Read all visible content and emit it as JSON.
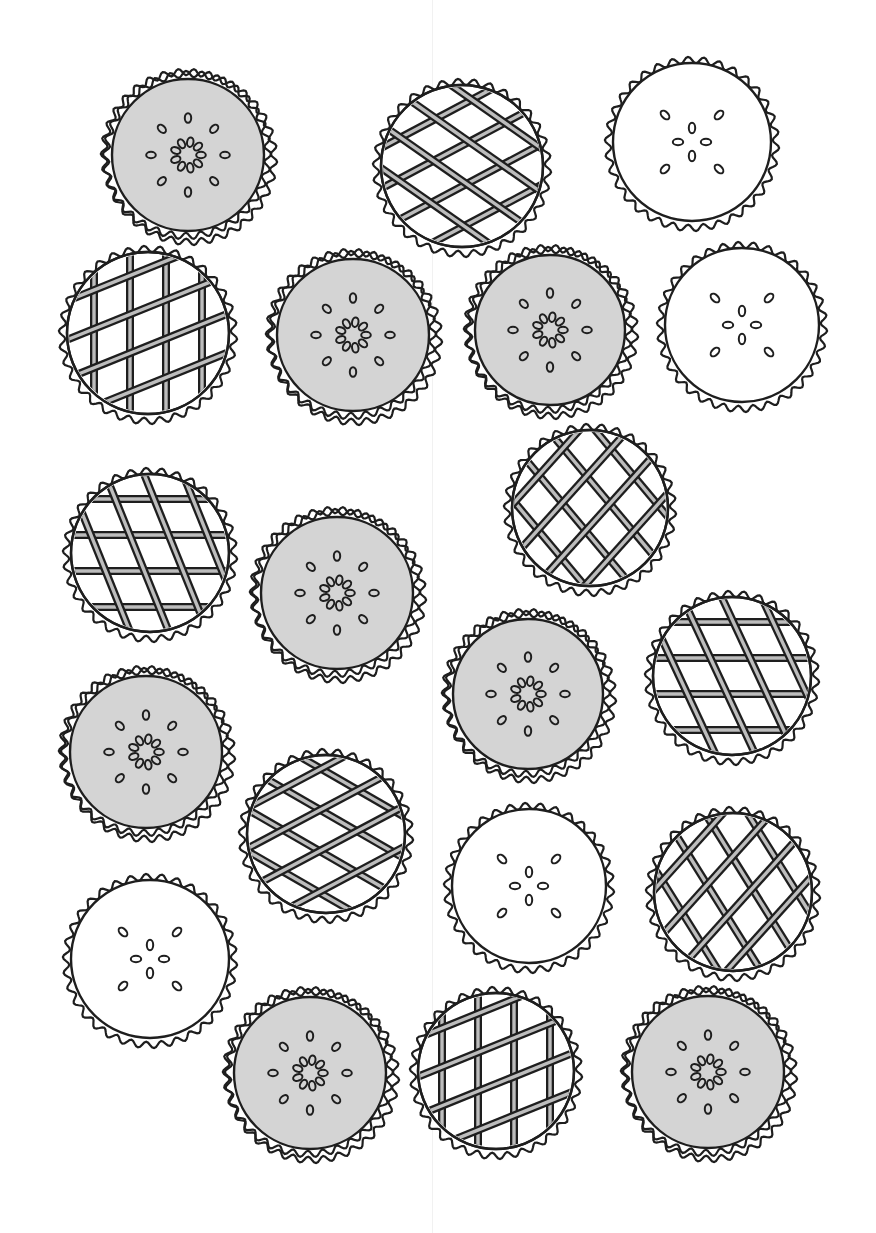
{
  "page": {
    "kind": "coloring page illustration",
    "background": "#ffffff",
    "ink_color": "#1e1e1e",
    "filling_gray": "#d4d4d4",
    "lattice_strip_fill": "#bdbdbd"
  },
  "pie_types": {
    "seed": "gray-filled pie with ring of seeds",
    "lattice": "lattice-top pie",
    "slit": "plain white pie with X-pattern vents"
  },
  "pies": [
    {
      "id": 1,
      "type": "seed",
      "cx": 188,
      "cy": 155,
      "r": 86
    },
    {
      "id": 2,
      "type": "lattice",
      "cx": 462,
      "cy": 166,
      "r": 88,
      "a1": -28,
      "a2": 35
    },
    {
      "id": 3,
      "type": "slit",
      "cx": 692,
      "cy": 142,
      "r": 86
    },
    {
      "id": 4,
      "type": "lattice",
      "cx": 148,
      "cy": 333,
      "r": 88,
      "a1": 90,
      "a2": -22
    },
    {
      "id": 5,
      "type": "seed",
      "cx": 353,
      "cy": 335,
      "r": 86
    },
    {
      "id": 6,
      "type": "seed",
      "cx": 550,
      "cy": 330,
      "r": 85
    },
    {
      "id": 7,
      "type": "slit",
      "cx": 742,
      "cy": 325,
      "r": 84
    },
    {
      "id": 8,
      "type": "lattice",
      "cx": 590,
      "cy": 508,
      "r": 85,
      "a1": 50,
      "a2": -48
    },
    {
      "id": 9,
      "type": "lattice",
      "cx": 150,
      "cy": 553,
      "r": 86,
      "a1": 0,
      "a2": 68
    },
    {
      "id": 10,
      "type": "seed",
      "cx": 337,
      "cy": 593,
      "r": 86
    },
    {
      "id": 11,
      "type": "seed",
      "cx": 528,
      "cy": 694,
      "r": 85
    },
    {
      "id": 12,
      "type": "lattice",
      "cx": 732,
      "cy": 676,
      "r": 86,
      "a1": 0,
      "a2": 65
    },
    {
      "id": 13,
      "type": "seed",
      "cx": 146,
      "cy": 752,
      "r": 86
    },
    {
      "id": 14,
      "type": "lattice",
      "cx": 326,
      "cy": 834,
      "r": 86,
      "a1": 30,
      "a2": -28
    },
    {
      "id": 15,
      "type": "slit",
      "cx": 529,
      "cy": 886,
      "r": 84
    },
    {
      "id": 16,
      "type": "lattice",
      "cx": 733,
      "cy": 892,
      "r": 86,
      "a1": 58,
      "a2": -48
    },
    {
      "id": 17,
      "type": "slit",
      "cx": 150,
      "cy": 959,
      "r": 86
    },
    {
      "id": 18,
      "type": "seed",
      "cx": 310,
      "cy": 1073,
      "r": 86
    },
    {
      "id": 19,
      "type": "lattice",
      "cx": 496,
      "cy": 1071,
      "r": 85,
      "a1": 90,
      "a2": -22
    },
    {
      "id": 20,
      "type": "seed",
      "cx": 708,
      "cy": 1072,
      "r": 86
    }
  ]
}
